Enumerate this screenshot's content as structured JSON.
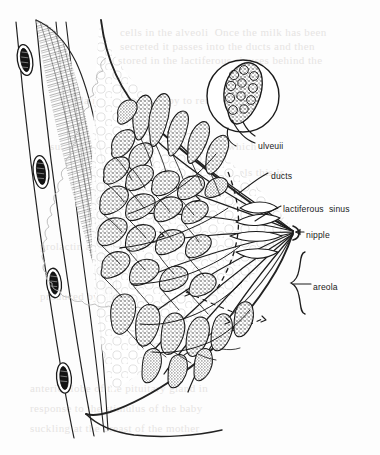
{
  "figure": {
    "domain_note": "line-art anatomical illustration scanned from a printed page",
    "background_color": "#fdfdfd",
    "ink_color": "#1b1b1b"
  },
  "labels": [
    {
      "id": "alveoli",
      "text": "ulveuii",
      "x": 258,
      "y": 146,
      "anchor": "start",
      "leader_from": [
        255,
        143
      ],
      "leader_to": [
        232,
        120
      ],
      "note": "printed label reads 'alveoli' but scan renders as 'ulveuii'"
    },
    {
      "id": "ducts",
      "text": "ducts",
      "x": 271,
      "y": 176,
      "anchor": "start",
      "leader_from": [
        268,
        173
      ],
      "leader_to": [
        238,
        194
      ]
    },
    {
      "id": "lactiferous-sinus",
      "text": "lactiferous  sinus",
      "x": 283,
      "y": 209,
      "anchor": "start",
      "leader_from": [
        281,
        206
      ],
      "leader_to": [
        255,
        221
      ]
    },
    {
      "id": "nipple",
      "text": "nipple",
      "x": 306,
      "y": 235,
      "anchor": "start",
      "leader_from": [
        304,
        232
      ],
      "leader_to": [
        294,
        232
      ]
    },
    {
      "id": "areola",
      "text": "areola",
      "x": 313,
      "y": 287,
      "anchor": "start",
      "leader_from": [
        311,
        284
      ],
      "leader_to": [
        303,
        284
      ]
    }
  ],
  "structures": {
    "chest_wall": {
      "name": "chest wall with ribs and pectoral muscle",
      "rib_count": 4,
      "rib_label": "rib cross-section"
    },
    "inset": {
      "name": "magnified alveolus cluster",
      "center_x": 243,
      "center_y": 96,
      "radius": 36
    },
    "lobules": {
      "name": "mammary lobules (alveoli clusters)",
      "count": 34
    },
    "nipple_point": {
      "x": 294,
      "y": 232
    }
  },
  "ghost_text_lines": [
    {
      "x": 120,
      "y": 36,
      "text": "cells in the alveoli  Once the milk has been"
    },
    {
      "x": 120,
      "y": 50,
      "text": "secreted it passes into the ducts and then"
    },
    {
      "x": 118,
      "y": 64,
      "text": "stored in the lactiferous sinuses behind the"
    },
    {
      "x": 60,
      "y": 104,
      "text": "areola ready for the baby to remove it by"
    },
    {
      "x": 50,
      "y": 150,
      "text": "suckling at the breast.  The hormone which"
    },
    {
      "x": 214,
      "y": 176,
      "text": "controls this is"
    },
    {
      "x": 40,
      "y": 250,
      "text": "prolactin and it is"
    },
    {
      "x": 40,
      "y": 300,
      "text": "produced by the"
    },
    {
      "x": 30,
      "y": 392,
      "text": "anterior lobe of the pituitary gland in"
    },
    {
      "x": 30,
      "y": 412,
      "text": "response to the stimulus of the baby"
    },
    {
      "x": 30,
      "y": 432,
      "text": "suckling at the breast of the mother"
    }
  ]
}
